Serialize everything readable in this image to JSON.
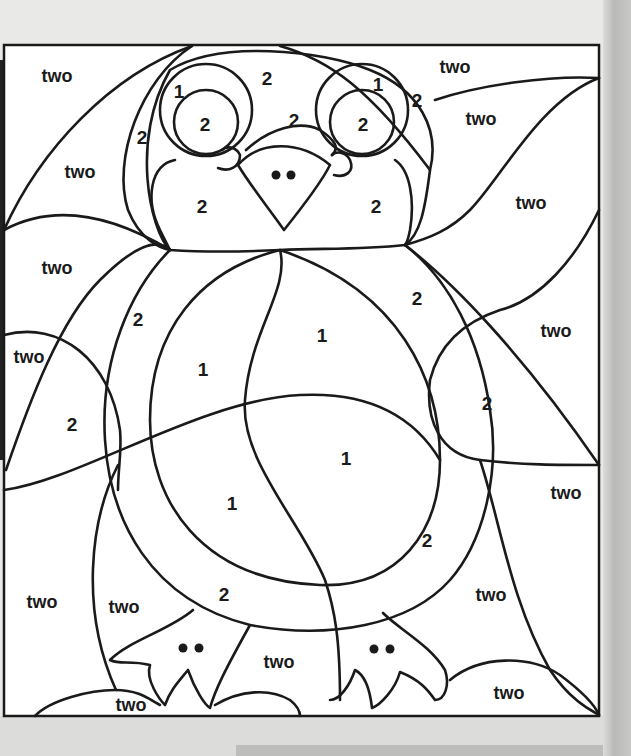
{
  "page": {
    "type": "color-by-number worksheet"
  },
  "colors": {
    "paper": "#ffffff",
    "line": "#1a1a1a",
    "surround": "#e8e8e6"
  },
  "labels": [
    {
      "text": "two",
      "x": 57,
      "y": 76
    },
    {
      "text": "2",
      "x": 267,
      "y": 78
    },
    {
      "text": "two",
      "x": 455,
      "y": 67
    },
    {
      "text": "1",
      "x": 179,
      "y": 91
    },
    {
      "text": "1",
      "x": 378,
      "y": 84
    },
    {
      "text": "2",
      "x": 417,
      "y": 100
    },
    {
      "text": "2",
      "x": 205,
      "y": 124
    },
    {
      "text": "2",
      "x": 294,
      "y": 120
    },
    {
      "text": "2",
      "x": 363,
      "y": 124
    },
    {
      "text": "two",
      "x": 481,
      "y": 119
    },
    {
      "text": "2",
      "x": 142,
      "y": 137
    },
    {
      "text": "two",
      "x": 80,
      "y": 172
    },
    {
      "text": "2",
      "x": 202,
      "y": 206
    },
    {
      "text": "2",
      "x": 376,
      "y": 206
    },
    {
      "text": "two",
      "x": 531,
      "y": 203
    },
    {
      "text": "two",
      "x": 57,
      "y": 268
    },
    {
      "text": "2",
      "x": 417,
      "y": 298
    },
    {
      "text": "2",
      "x": 138,
      "y": 319
    },
    {
      "text": "1",
      "x": 322,
      "y": 335
    },
    {
      "text": "two",
      "x": 556,
      "y": 331
    },
    {
      "text": "two",
      "x": 29,
      "y": 357
    },
    {
      "text": "1",
      "x": 203,
      "y": 369
    },
    {
      "text": "2",
      "x": 487,
      "y": 403
    },
    {
      "text": "2",
      "x": 72,
      "y": 424
    },
    {
      "text": "1",
      "x": 346,
      "y": 458
    },
    {
      "text": "two",
      "x": 566,
      "y": 493
    },
    {
      "text": "1",
      "x": 232,
      "y": 503
    },
    {
      "text": "2",
      "x": 427,
      "y": 540
    },
    {
      "text": "2",
      "x": 224,
      "y": 594
    },
    {
      "text": "two",
      "x": 42,
      "y": 602
    },
    {
      "text": "two",
      "x": 124,
      "y": 607
    },
    {
      "text": "two",
      "x": 491,
      "y": 595
    },
    {
      "text": "two",
      "x": 279,
      "y": 662
    },
    {
      "text": "two",
      "x": 509,
      "y": 693
    },
    {
      "text": "two",
      "x": 131,
      "y": 705
    }
  ]
}
